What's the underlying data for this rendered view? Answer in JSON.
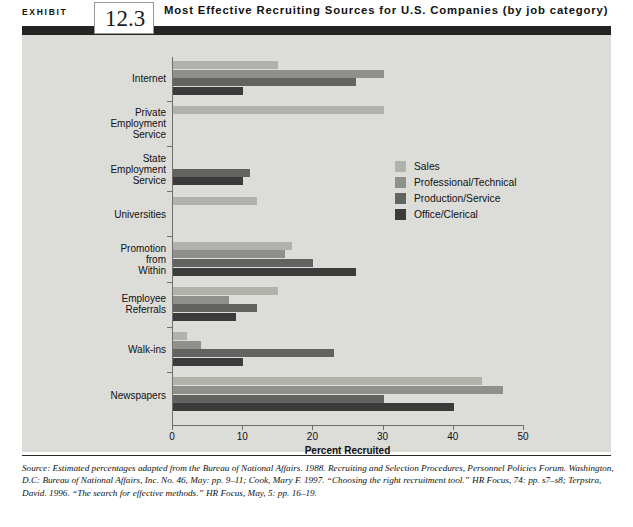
{
  "header": {
    "exhibit_word": "EXHIBIT",
    "exhibit_number": "12.3",
    "title": "Most Effective Recruiting Sources for U.S. Companies (by job category)"
  },
  "source_note": "Source: Estimated percentages adapted from the Bureau of National Affairs. 1988. Recruiting and Selection Procedures, Personnel Policies Forum. Washington, D.C: Bureau of National Affairs, Inc. No. 46, May: pp. 9–11; Cook, Mary F. 1997. “Choosing the right recruitment tool.” HR Focus, 74: pp. s7–s8; Terpstra, David. 1996. “The search for effective methods.” HR Focus, May, 5: pp. 16–19.",
  "chart_data": {
    "type": "bar",
    "orientation": "horizontal",
    "title": "Most Effective Recruiting Sources for U.S. Companies (by job category)",
    "xlabel": "Percent Recruited",
    "ylabel": "",
    "xlim": [
      0,
      50
    ],
    "xticks": [
      0,
      10,
      20,
      30,
      40,
      50
    ],
    "xtick_labels": [
      "0",
      "10",
      "20",
      "30",
      "40",
      "50"
    ],
    "grid": false,
    "legend_position": "center-right",
    "categories": [
      "Internet",
      "Private Employment Service",
      "State Employment Service",
      "Universities",
      "Promotion from Within",
      "Employee Referrals",
      "Walk-ins",
      "Newspapers"
    ],
    "category_label_lines": [
      [
        "Internet"
      ],
      [
        "Private",
        "Employment",
        "Service"
      ],
      [
        "State",
        "Employment",
        "Service"
      ],
      [
        "Universities"
      ],
      [
        "Promotion",
        "from",
        "Within"
      ],
      [
        "Employee",
        "Referrals"
      ],
      [
        "Walk-ins"
      ],
      [
        "Newspapers"
      ]
    ],
    "series": [
      {
        "name": "Sales",
        "color": "#b2b2ad",
        "values": [
          15,
          30,
          0,
          12,
          17,
          15,
          2,
          44
        ]
      },
      {
        "name": "Professional/Technical",
        "color": "#8f8f8c",
        "values": [
          30,
          0,
          0,
          0,
          16,
          8,
          4,
          47
        ]
      },
      {
        "name": "Production/Service",
        "color": "#636362",
        "values": [
          26,
          0,
          11,
          0,
          20,
          12,
          23,
          30
        ]
      },
      {
        "name": "Office/Clerical",
        "color": "#3b3b3b",
        "values": [
          10,
          0,
          10,
          0,
          26,
          9,
          10,
          40
        ]
      }
    ]
  }
}
